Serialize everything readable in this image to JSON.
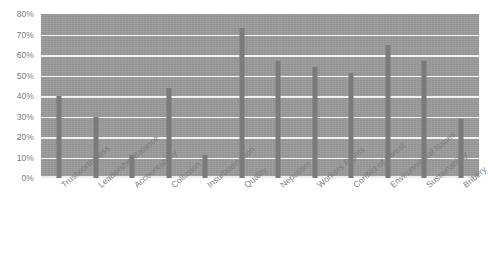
{
  "chart_data": {
    "type": "bar",
    "title": "",
    "xlabel": "",
    "ylabel": "",
    "ylim": [
      0,
      80
    ],
    "grid": true,
    "legend": "none",
    "y_ticks": [
      "80%",
      "70%",
      "60%",
      "50%",
      "40%",
      "30%",
      "20%",
      "10%",
      "0%"
    ],
    "y_tick_values": [
      80,
      70,
      60,
      50,
      40,
      30,
      20,
      10,
      0
    ],
    "categories": [
      "Trustworthiness",
      "Leadership Balance",
      "Accountability",
      "Collusion",
      "Insurbodination",
      "Quality",
      "Nepotism",
      "Workers Rights",
      "Conflict of Intrest",
      "Environmental Issues",
      "Sustainability",
      "Bribery"
    ],
    "values": [
      40,
      30,
      11,
      44,
      11,
      73,
      57,
      54,
      51,
      65,
      57,
      29
    ],
    "value_labels": [
      "40%",
      "30%",
      "11%",
      "44%",
      "11%",
      "73%",
      "57%",
      "54%",
      "51%",
      "65%",
      "57%",
      "29%"
    ],
    "colors": {
      "bar": "#7b7b7b",
      "plot_background": "#9a9a9a",
      "gridline": "#f2f2f2",
      "tick_label": "#7a7a7a",
      "page_background": "#ffffff"
    }
  }
}
